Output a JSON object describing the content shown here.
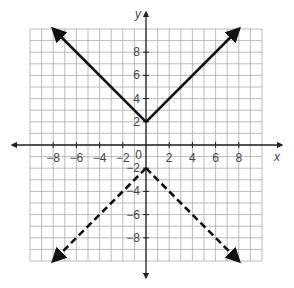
{
  "chart_data": {
    "type": "line",
    "title": "",
    "xlabel": "x",
    "ylabel": "y",
    "xlim": [
      -10,
      10
    ],
    "ylim": [
      -10,
      10
    ],
    "grid": true,
    "x_ticks": [
      -8,
      -6,
      -4,
      -2,
      2,
      4,
      6,
      8
    ],
    "y_ticks": [
      8,
      6,
      4,
      2,
      -2,
      -4,
      -6,
      -8
    ],
    "origin_label": "0",
    "series": [
      {
        "name": "solid V (opens up)",
        "style": "solid",
        "vertex": [
          0,
          2
        ],
        "points": [
          [
            -8,
            10
          ],
          [
            0,
            2
          ],
          [
            8,
            10
          ]
        ],
        "arrows": "both"
      },
      {
        "name": "dashed inverted V (opens down)",
        "style": "dashed",
        "vertex": [
          0,
          -2
        ],
        "points": [
          [
            -8,
            -10
          ],
          [
            0,
            -2
          ],
          [
            8,
            -10
          ]
        ],
        "arrows": "both"
      }
    ]
  }
}
